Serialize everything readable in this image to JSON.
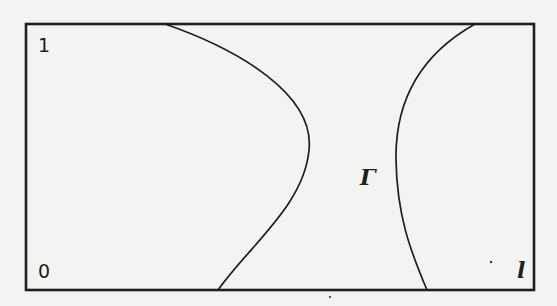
{
  "figure": {
    "colors": {
      "background": "#f3f3f1",
      "stroke": "#1e1e1e"
    },
    "domain_box": {
      "x": 26,
      "y": 24,
      "width": 508,
      "height": 266,
      "stroke_width": 2.6
    },
    "curves": [
      {
        "name": "left-curve",
        "path": "M 165 24 C 240 50, 315 95, 309 150 C 304 205, 250 245, 218 290",
        "stroke_width": 1.7
      },
      {
        "name": "right-curve-gamma",
        "path": "M 475 24 C 420 55, 395 100, 396 160 C 397 215, 410 250, 427 290",
        "stroke_width": 1.7
      }
    ],
    "labels": {
      "y_top": "1",
      "origin": "0",
      "boundary": "Γ",
      "x_right": "l"
    },
    "specks": [
      {
        "x": 491,
        "y": 262,
        "r": 1.2
      },
      {
        "x": 330,
        "y": 297,
        "r": 1.1
      }
    ]
  }
}
